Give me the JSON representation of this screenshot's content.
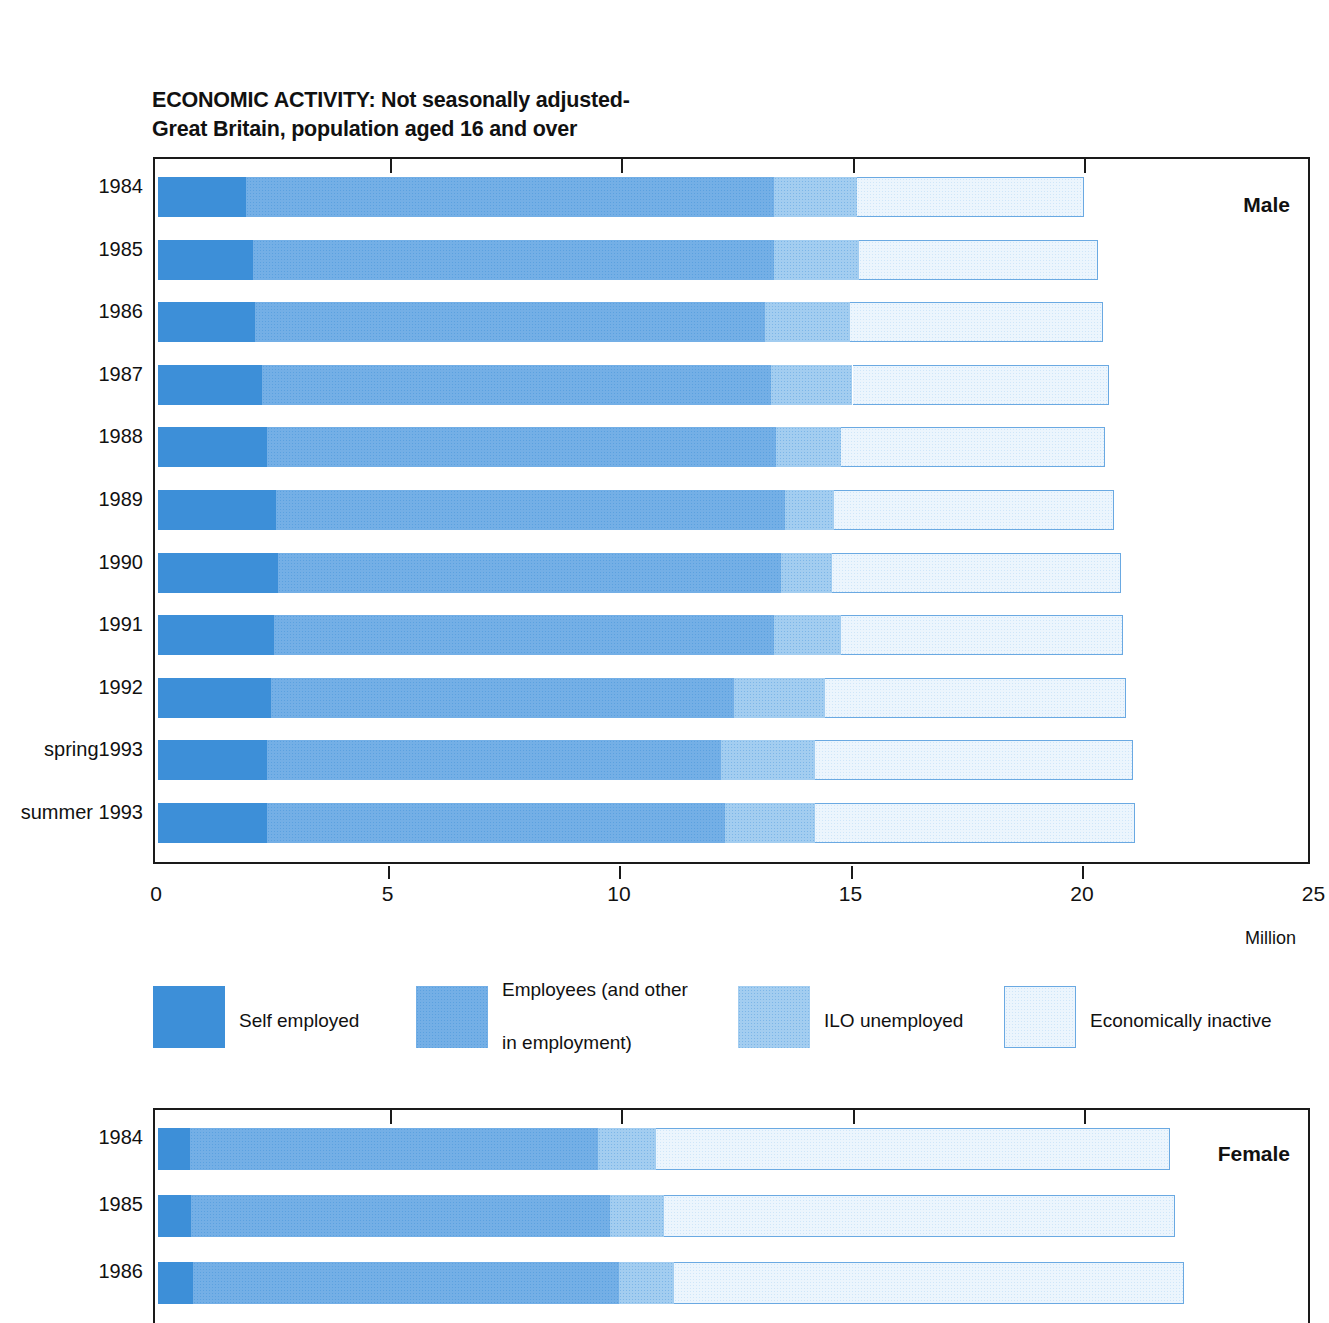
{
  "chart_data": {
    "type": "bar",
    "orientation": "horizontal",
    "stacked": true,
    "title": "ECONOMIC ACTIVITY: Not seasonally adjusted- Great Britain, population aged 16 and over",
    "title_lines": [
      "ECONOMIC ACTIVITY: Not seasonally adjusted-",
      "Great Britain, population aged 16 and over"
    ],
    "xlabel": "Million",
    "ylabel": "",
    "xlim": [
      0,
      25
    ],
    "xticks": [
      0,
      5,
      10,
      15,
      20,
      25
    ],
    "xtick_labels": [
      "0",
      "5",
      "10",
      "15",
      "20",
      "25"
    ],
    "grid": true,
    "legend_position": "below-top-panel",
    "series": [
      {
        "name": "Self employed",
        "color": "#3d8fd8"
      },
      {
        "name": "Employees (and other in employment)",
        "color": "#74afe6"
      },
      {
        "name": "ILO unemployed",
        "color": "#a3cdf0"
      },
      {
        "name": "Economically inactive",
        "color": "#ecf5fd"
      }
    ],
    "panels": [
      {
        "label": "Male",
        "categories": [
          "1984",
          "1985",
          "1986",
          "1987",
          "1988",
          "1989",
          "1990",
          "1991",
          "1992",
          "spring1993",
          "summer 1993"
        ],
        "values": {
          "Self employed": [
            1.9,
            2.05,
            2.1,
            2.25,
            2.35,
            2.55,
            2.6,
            2.5,
            2.45,
            2.35,
            2.35
          ],
          "Employees (and other in employment)": [
            11.4,
            11.25,
            11.0,
            11.0,
            11.0,
            11.0,
            10.85,
            10.8,
            10.0,
            9.8,
            9.9
          ],
          "ILO unemployed": [
            1.8,
            1.85,
            1.85,
            1.75,
            1.4,
            1.05,
            1.1,
            1.45,
            1.95,
            2.05,
            1.95
          ],
          "Economically inactive": [
            4.9,
            5.15,
            5.45,
            5.55,
            5.7,
            6.05,
            6.25,
            6.1,
            6.5,
            6.85,
            6.9
          ]
        },
        "totals": [
          20.0,
          20.3,
          20.4,
          20.55,
          20.45,
          20.65,
          20.8,
          20.85,
          20.9,
          21.05,
          21.1
        ]
      },
      {
        "label": "Female",
        "categories": [
          "1984",
          "1985",
          "1986"
        ],
        "values": {
          "Self employed": [
            0.7,
            0.72,
            0.75
          ],
          "Employees (and other in employment)": [
            8.8,
            9.05,
            9.2
          ],
          "ILO unemployed": [
            1.25,
            1.15,
            1.2
          ],
          "Economically inactive": [
            11.1,
            11.05,
            11.0
          ]
        },
        "totals": [
          21.85,
          21.97,
          22.15
        ]
      }
    ]
  },
  "male_panel": {
    "label": "Male",
    "years": [
      "1984",
      "1985",
      "1986",
      "1987",
      "1988",
      "1989",
      "1990",
      "1991",
      "1992",
      "spring1993",
      "summer 1993"
    ]
  },
  "female_panel": {
    "label": "Female",
    "years": [
      "1984",
      "1985",
      "1986"
    ]
  },
  "axis": {
    "ticks": [
      "0",
      "5",
      "10",
      "15",
      "20",
      "25"
    ],
    "unit_label": "Million"
  },
  "legend": {
    "items": [
      {
        "label": "Self employed",
        "label_line2": ""
      },
      {
        "label": "Employees (and other",
        "label_line2": "in employment)"
      },
      {
        "label": "ILO unemployed",
        "label_line2": ""
      },
      {
        "label": "Economically inactive",
        "label_line2": ""
      }
    ]
  }
}
